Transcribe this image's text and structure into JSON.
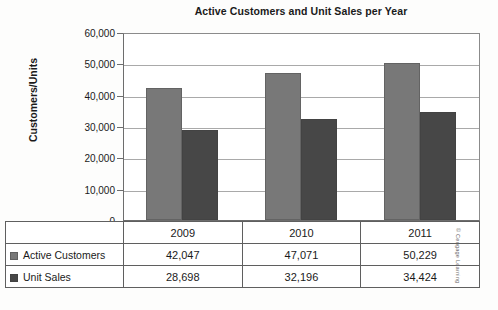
{
  "chart_data": {
    "type": "bar",
    "title": "Active Customers and Unit Sales per Year",
    "xlabel": "",
    "ylabel": "Customers/Units",
    "categories": [
      "2009",
      "2010",
      "2011"
    ],
    "series": [
      {
        "name": "Active Customers",
        "values": [
          42047,
          47071,
          50229
        ],
        "color": "#787878"
      },
      {
        "name": "Unit Sales",
        "values": [
          28698,
          32196,
          34424
        ],
        "color": "#474747"
      }
    ],
    "ylim": [
      0,
      60000
    ],
    "ytick_labels": [
      "60,000",
      "50,000",
      "40,000",
      "30,000",
      "20,000",
      "10,000",
      "0"
    ],
    "ytick_values": [
      60000,
      50000,
      40000,
      30000,
      20000,
      10000,
      0
    ],
    "grid": true,
    "legend_position": "data-table-left"
  },
  "table": {
    "year_header": [
      "2009",
      "2010",
      "2011"
    ],
    "rows": [
      {
        "label": "Active Customers",
        "values": [
          "42,047",
          "47,071",
          "50,229"
        ]
      },
      {
        "label": "Unit Sales",
        "values": [
          "28,698",
          "32,196",
          "34,424"
        ]
      }
    ]
  },
  "credit": "© Cengage Learning"
}
